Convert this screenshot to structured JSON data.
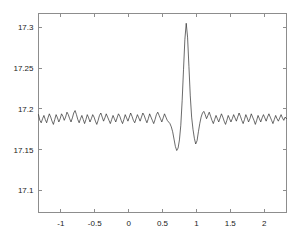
{
  "chart_data": {
    "type": "line",
    "title": "",
    "xlabel": "",
    "ylabel": "",
    "xlim": [
      -1.33,
      2.33
    ],
    "ylim": [
      17.073,
      17.317
    ],
    "grid": false,
    "legend": false,
    "xticks": [
      -1,
      -0.5,
      0,
      0.5,
      1,
      1.5,
      2
    ],
    "xticklabels": [
      "-1",
      "-0.5",
      "0",
      "0.5",
      "1",
      "1.5",
      "2"
    ],
    "yticks": [
      17.1,
      17.15,
      17.2,
      17.25,
      17.3
    ],
    "yticklabels": [
      "17.1",
      "17.15",
      "17.2",
      "17.25",
      "17.3"
    ],
    "line_color": "#2b2b2b",
    "axis_color": "#8d8d8d",
    "background_color": "#ffffff",
    "baseline_level": 17.19,
    "peak": {
      "x": 0.84,
      "y": 17.305
    },
    "left_dip": {
      "x": 0.7,
      "y": 17.149
    },
    "right_dip": {
      "x": 0.99,
      "y": 17.157
    },
    "series": [
      {
        "name": "signal",
        "x": [
          -1.33,
          -1.31,
          -1.29,
          -1.27,
          -1.25,
          -1.23,
          -1.21,
          -1.19,
          -1.17,
          -1.15,
          -1.13,
          -1.11,
          -1.09,
          -1.07,
          -1.05,
          -1.03,
          -1.01,
          -0.99,
          -0.97,
          -0.95,
          -0.93,
          -0.91,
          -0.89,
          -0.87,
          -0.85,
          -0.83,
          -0.81,
          -0.79,
          -0.77,
          -0.75,
          -0.73,
          -0.71,
          -0.69,
          -0.67,
          -0.65,
          -0.63,
          -0.61,
          -0.59,
          -0.57,
          -0.55,
          -0.53,
          -0.51,
          -0.49,
          -0.47,
          -0.45,
          -0.43,
          -0.41,
          -0.39,
          -0.37,
          -0.35,
          -0.33,
          -0.31,
          -0.29,
          -0.27,
          -0.25,
          -0.23,
          -0.21,
          -0.19,
          -0.17,
          -0.15,
          -0.13,
          -0.11,
          -0.09,
          -0.07,
          -0.05,
          -0.03,
          -0.01,
          0.01,
          0.03,
          0.05,
          0.07,
          0.09,
          0.11,
          0.13,
          0.15,
          0.17,
          0.19,
          0.21,
          0.23,
          0.25,
          0.27,
          0.29,
          0.31,
          0.33,
          0.35,
          0.37,
          0.39,
          0.41,
          0.43,
          0.45,
          0.47,
          0.49,
          0.51,
          0.53,
          0.55,
          0.57,
          0.59,
          0.61,
          0.63,
          0.65,
          0.67,
          0.69,
          0.71,
          0.73,
          0.75,
          0.77,
          0.79,
          0.81,
          0.83,
          0.85,
          0.87,
          0.89,
          0.91,
          0.93,
          0.95,
          0.97,
          0.99,
          1.01,
          1.03,
          1.05,
          1.07,
          1.09,
          1.11,
          1.13,
          1.15,
          1.17,
          1.19,
          1.21,
          1.23,
          1.25,
          1.27,
          1.29,
          1.31,
          1.33,
          1.35,
          1.37,
          1.39,
          1.41,
          1.43,
          1.45,
          1.47,
          1.49,
          1.51,
          1.53,
          1.55,
          1.57,
          1.59,
          1.61,
          1.63,
          1.65,
          1.67,
          1.69,
          1.71,
          1.73,
          1.75,
          1.77,
          1.79,
          1.81,
          1.83,
          1.85,
          1.87,
          1.89,
          1.91,
          1.93,
          1.95,
          1.97,
          1.99,
          2.01,
          2.03,
          2.05,
          2.07,
          2.09,
          2.11,
          2.13,
          2.15,
          2.17,
          2.19,
          2.21,
          2.23,
          2.25,
          2.27,
          2.29,
          2.31,
          2.33
        ],
        "y": [
          17.193,
          17.186,
          17.183,
          17.188,
          17.192,
          17.187,
          17.183,
          17.189,
          17.194,
          17.19,
          17.185,
          17.181,
          17.187,
          17.193,
          17.189,
          17.184,
          17.188,
          17.194,
          17.191,
          17.186,
          17.19,
          17.196,
          17.193,
          17.188,
          17.184,
          17.189,
          17.195,
          17.198,
          17.193,
          17.187,
          17.183,
          17.188,
          17.192,
          17.187,
          17.182,
          17.187,
          17.193,
          17.189,
          17.184,
          17.188,
          17.193,
          17.19,
          17.185,
          17.181,
          17.186,
          17.192,
          17.195,
          17.19,
          17.185,
          17.189,
          17.194,
          17.19,
          17.186,
          17.182,
          17.187,
          17.192,
          17.188,
          17.184,
          17.189,
          17.194,
          17.191,
          17.186,
          17.182,
          17.187,
          17.193,
          17.189,
          17.185,
          17.19,
          17.195,
          17.191,
          17.186,
          17.183,
          17.188,
          17.193,
          17.189,
          17.185,
          17.19,
          17.195,
          17.192,
          17.187,
          17.183,
          17.188,
          17.194,
          17.19,
          17.186,
          17.182,
          17.187,
          17.193,
          17.196,
          17.192,
          17.188,
          17.184,
          17.189,
          17.194,
          17.19,
          17.186,
          17.184,
          17.182,
          17.178,
          17.172,
          17.163,
          17.154,
          17.149,
          17.152,
          17.162,
          17.18,
          17.21,
          17.248,
          17.285,
          17.305,
          17.288,
          17.252,
          17.216,
          17.19,
          17.175,
          17.164,
          17.157,
          17.161,
          17.172,
          17.182,
          17.19,
          17.195,
          17.197,
          17.193,
          17.188,
          17.192,
          17.196,
          17.191,
          17.186,
          17.182,
          17.187,
          17.192,
          17.188,
          17.184,
          17.189,
          17.194,
          17.19,
          17.185,
          17.181,
          17.186,
          17.192,
          17.188,
          17.184,
          17.188,
          17.193,
          17.189,
          17.185,
          17.19,
          17.195,
          17.191,
          17.186,
          17.182,
          17.187,
          17.193,
          17.189,
          17.184,
          17.188,
          17.194,
          17.19,
          17.186,
          17.181,
          17.186,
          17.192,
          17.188,
          17.184,
          17.189,
          17.193,
          17.189,
          17.185,
          17.19,
          17.194,
          17.19,
          17.186,
          17.182,
          17.187,
          17.192,
          17.188,
          17.185,
          17.189,
          17.193,
          17.189,
          17.186,
          17.19,
          17.188
        ]
      }
    ]
  }
}
